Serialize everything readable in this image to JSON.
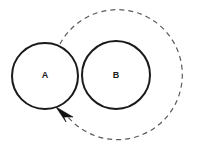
{
  "figure": {
    "width": 198,
    "height": 151,
    "background_color": "#ffffff",
    "kind": "geometry-diagram"
  },
  "circles": [
    {
      "id": "circle-a",
      "label": "A",
      "cx": 45,
      "cy": 76,
      "r": 33,
      "stroke_color": "#1a1a1a",
      "stroke_width": 2,
      "fill_color": "#ffffff",
      "label_x": 45,
      "label_y": 75,
      "label_font_size": 9
    },
    {
      "id": "circle-b",
      "label": "B",
      "cx": 116,
      "cy": 75,
      "r": 34,
      "stroke_color": "#1a1a1a",
      "stroke_width": 2,
      "fill_color": "#ffffff",
      "label_x": 116,
      "label_y": 75,
      "label_font_size": 9
    }
  ],
  "dashed_path": {
    "id": "rolling-path-arc",
    "stroke_color": "#5a5a5a",
    "stroke_width": 1.2,
    "dash_pattern": "5 4",
    "center_x": 116,
    "center_y": 77,
    "radius": 65,
    "start_x": 60,
    "start_y": 44,
    "end_x": 68,
    "end_y": 117,
    "sweep": "clockwise",
    "path_d": "M 60 44 A 65 65 0 1 1 68 117"
  },
  "arrow_head": {
    "id": "direction-arrowhead",
    "tip_x": 56,
    "tip_y": 107,
    "points": "56,107 73,117 64,117 66,122",
    "fill_color": "#111111",
    "direction": "up-left"
  }
}
